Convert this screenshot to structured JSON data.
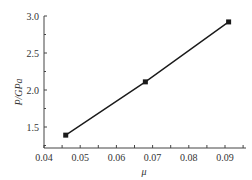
{
  "chart_data": {
    "type": "line",
    "title": "",
    "xlabel": "μ",
    "ylabel": "P/GPa",
    "xlim": [
      0.04,
      0.096
    ],
    "ylim": [
      1.2,
      3.0
    ],
    "x_ticks": [
      "0.04",
      "0.05",
      "0.06",
      "0.07",
      "0.08",
      "0.09"
    ],
    "y_ticks": [
      "1.5",
      "2.0",
      "2.5",
      "3.0"
    ],
    "grid": false,
    "legend": null,
    "series": [
      {
        "name": "P vs μ",
        "marker": "square",
        "color": "#1a1a1a",
        "x": [
          0.046,
          0.068,
          0.091
        ],
        "y": [
          1.39,
          2.11,
          2.92
        ]
      }
    ]
  }
}
